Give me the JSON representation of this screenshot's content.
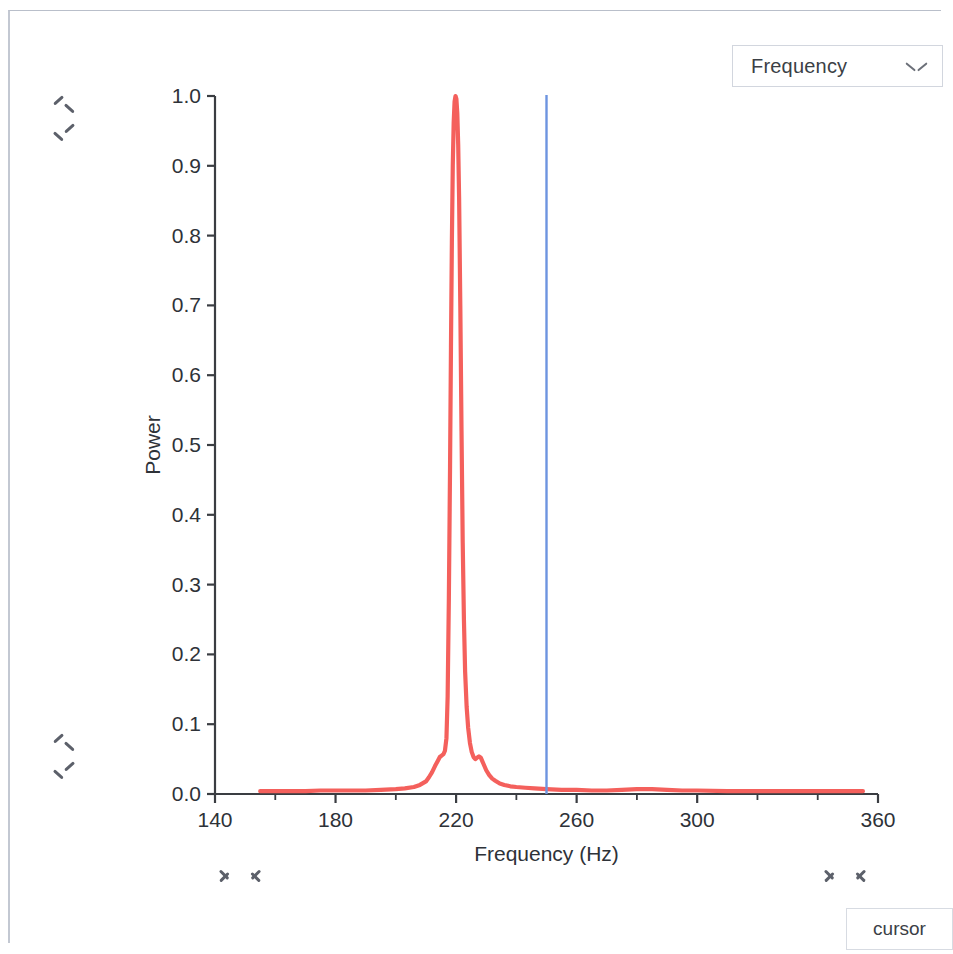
{
  "window": {
    "title": "Spectrum Viewer"
  },
  "toolbar": {
    "mode_select": {
      "name": "frequency-mode-select",
      "value": "Frequency",
      "icon": "chevron-down-icon",
      "options": [
        "Frequency"
      ]
    }
  },
  "controls": {
    "vertical_nav_top": {
      "up": "scroll-up",
      "down": "scroll-down"
    },
    "vertical_nav_bottom": {
      "up": "scroll-up",
      "down": "scroll-down"
    },
    "horizontal_nav_left": {
      "prev": "step-left",
      "next": "step-right"
    },
    "horizontal_nav_right": {
      "prev": "step-left",
      "next": "step-right"
    },
    "cursor_button_label": "cursor"
  },
  "colors": {
    "trace": "#f4605c",
    "cursor_line": "#6d94e0",
    "axis": "#3a3d42",
    "border": "#c3c8d2",
    "text": "#2e3238"
  },
  "chart_data": {
    "type": "line",
    "title": "",
    "xlabel": "Frequency (Hz)",
    "ylabel": "Power",
    "xlim": [
      140,
      360
    ],
    "ylim": [
      0.0,
      1.0
    ],
    "xticks": [
      140,
      180,
      220,
      260,
      300,
      360
    ],
    "xtick_labels": [
      "140",
      "180",
      "220",
      "260",
      "300",
      "360"
    ],
    "xticks_minor": [
      160,
      200,
      240,
      280,
      320,
      340
    ],
    "yticks": [
      0.0,
      0.1,
      0.2,
      0.3,
      0.4,
      0.5,
      0.6,
      0.7,
      0.8,
      0.9,
      1.0
    ],
    "ytick_labels": [
      "0.0",
      "0.1",
      "0.2",
      "0.3",
      "0.4",
      "0.5",
      "0.6",
      "0.7",
      "0.8",
      "0.9",
      "1.0"
    ],
    "grid": false,
    "legend": null,
    "annotations": [
      {
        "type": "vertical-cursor",
        "name": "cursor-line",
        "x": 250.0,
        "color": "#6d94e0"
      }
    ],
    "series": [
      {
        "name": "power-spectrum",
        "color": "#f4605c",
        "x": [
          155,
          160,
          165,
          170,
          175,
          180,
          185,
          190,
          195,
          200,
          203,
          206,
          208,
          210,
          211,
          212,
          213,
          214,
          214.6,
          215.2,
          215.8,
          216.3,
          216.8,
          217.2,
          217.6,
          218.0,
          218.3,
          218.6,
          218.9,
          219.2,
          219.5,
          219.8,
          220.1,
          220.4,
          220.7,
          221.0,
          221.4,
          221.8,
          222.2,
          222.6,
          223.0,
          223.5,
          224.0,
          224.6,
          225.2,
          225.8,
          226.4,
          227.0,
          227.6,
          228.2,
          229.0,
          230.0,
          231.0,
          232.0,
          233.0,
          234.5,
          236.0,
          238.0,
          240.0,
          243.0,
          246.0,
          250.0,
          255.0,
          260.0,
          265.0,
          270.0,
          275.0,
          280.0,
          285.0,
          290.0,
          295.0,
          300.0,
          310.0,
          320.0,
          330.0,
          340.0,
          350.0,
          355.0
        ],
        "y": [
          0.004,
          0.004,
          0.004,
          0.004,
          0.005,
          0.005,
          0.005,
          0.005,
          0.006,
          0.007,
          0.008,
          0.01,
          0.013,
          0.018,
          0.024,
          0.031,
          0.04,
          0.048,
          0.053,
          0.055,
          0.057,
          0.062,
          0.08,
          0.14,
          0.28,
          0.47,
          0.64,
          0.79,
          0.9,
          0.962,
          0.992,
          1.0,
          0.996,
          0.975,
          0.93,
          0.855,
          0.7,
          0.52,
          0.36,
          0.25,
          0.175,
          0.125,
          0.095,
          0.073,
          0.06,
          0.053,
          0.05,
          0.052,
          0.054,
          0.052,
          0.044,
          0.034,
          0.027,
          0.022,
          0.019,
          0.015,
          0.013,
          0.011,
          0.01,
          0.009,
          0.008,
          0.007,
          0.006,
          0.006,
          0.005,
          0.005,
          0.006,
          0.007,
          0.007,
          0.006,
          0.005,
          0.005,
          0.004,
          0.004,
          0.004,
          0.004,
          0.004,
          0.004
        ]
      }
    ]
  }
}
